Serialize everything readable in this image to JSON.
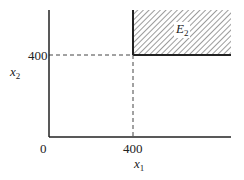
{
  "diagram": {
    "region_label": "E",
    "region_subscript": "2",
    "x_axis": {
      "label": "x",
      "subscript": "1",
      "ticks": [
        "0",
        "400"
      ]
    },
    "y_axis": {
      "label": "x",
      "subscript": "2",
      "ticks": [
        "400"
      ]
    },
    "region_description": "Shaded region where x1 ≥ 400 and x2 ≥ 400",
    "colors": {
      "axis": "#222222",
      "hatch": "#555555",
      "dashed": "#444444"
    }
  }
}
